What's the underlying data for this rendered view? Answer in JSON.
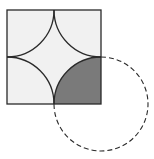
{
  "figure": {
    "colors": {
      "square_fill": "#f1f1f1",
      "stroke": "#2a2a2a",
      "shaded_region": "#7a7a7a",
      "background": "#ffffff"
    },
    "square": {
      "x": 7,
      "y": 10,
      "size": 94
    },
    "arc_radius": 47,
    "dashed_circle": {
      "cx": 101,
      "cy": 108,
      "r": 47
    }
  }
}
